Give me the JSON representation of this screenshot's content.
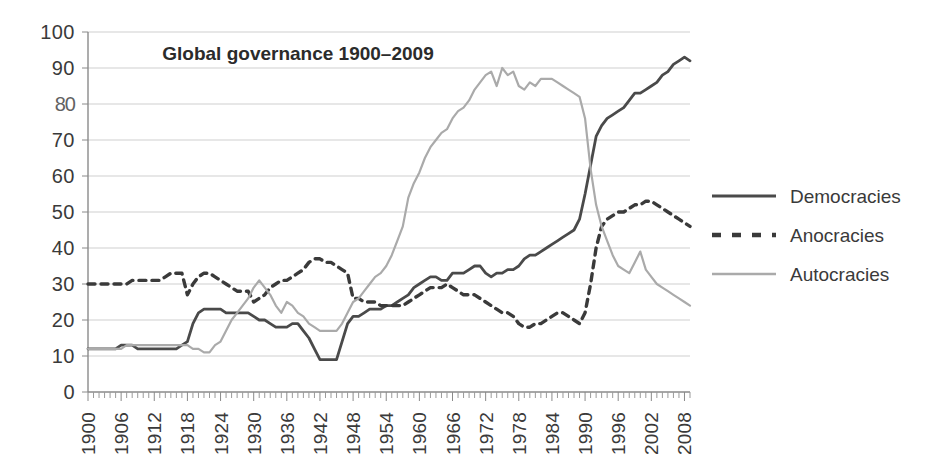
{
  "chart_data": {
    "type": "line",
    "title": "Global governance 1900–2009",
    "xlabel": "",
    "ylabel": "",
    "xlim": [
      1900,
      2009
    ],
    "ylim": [
      0,
      100
    ],
    "grid": true,
    "legend_position": "right",
    "y_ticks": [
      "0",
      "10",
      "20",
      "30",
      "40",
      "50",
      "60",
      "70",
      "80",
      "90",
      "100"
    ],
    "y_tick_values": [
      0,
      10,
      20,
      30,
      40,
      50,
      60,
      70,
      80,
      90,
      100
    ],
    "y_tick_degraded_index": 8,
    "x_ticks": [
      "1900",
      "1906",
      "1912",
      "1918",
      "1924",
      "1930",
      "1936",
      "1942",
      "1948",
      "1954",
      "1960",
      "1966",
      "1972",
      "1978",
      "1984",
      "1990",
      "1996",
      "2002",
      "2008"
    ],
    "x_tick_values": [
      1900,
      1906,
      1912,
      1918,
      1924,
      1930,
      1936,
      1942,
      1948,
      1954,
      1960,
      1966,
      1972,
      1978,
      1984,
      1990,
      1996,
      2002,
      2008
    ],
    "x_minor_step": 1,
    "x": [
      1900,
      1901,
      1902,
      1903,
      1904,
      1905,
      1906,
      1907,
      1908,
      1909,
      1910,
      1911,
      1912,
      1913,
      1914,
      1915,
      1916,
      1917,
      1918,
      1919,
      1920,
      1921,
      1922,
      1923,
      1924,
      1925,
      1926,
      1927,
      1928,
      1929,
      1930,
      1931,
      1932,
      1933,
      1934,
      1935,
      1936,
      1937,
      1938,
      1939,
      1940,
      1941,
      1942,
      1943,
      1944,
      1945,
      1946,
      1947,
      1948,
      1949,
      1950,
      1951,
      1952,
      1953,
      1954,
      1955,
      1956,
      1957,
      1958,
      1959,
      1960,
      1961,
      1962,
      1963,
      1964,
      1965,
      1966,
      1967,
      1968,
      1969,
      1970,
      1971,
      1972,
      1973,
      1974,
      1975,
      1976,
      1977,
      1978,
      1979,
      1980,
      1981,
      1982,
      1983,
      1984,
      1985,
      1986,
      1987,
      1988,
      1989,
      1990,
      1991,
      1992,
      1993,
      1994,
      1995,
      1996,
      1997,
      1998,
      1999,
      2000,
      2001,
      2002,
      2003,
      2004,
      2005,
      2006,
      2007,
      2008,
      2009
    ],
    "series": [
      {
        "name": "Democracies",
        "style": "solid",
        "color": "#4a4a4a",
        "values": [
          12,
          12,
          12,
          12,
          12,
          12,
          13,
          13,
          13,
          12,
          12,
          12,
          12,
          12,
          12,
          12,
          12,
          13,
          14,
          19,
          22,
          23,
          23,
          23,
          23,
          22,
          22,
          22,
          22,
          22,
          21,
          20,
          20,
          19,
          18,
          18,
          18,
          19,
          19,
          17,
          15,
          12,
          9,
          9,
          9,
          9,
          14,
          19,
          21,
          21,
          22,
          23,
          23,
          23,
          24,
          24,
          25,
          26,
          27,
          29,
          30,
          31,
          32,
          32,
          31,
          31,
          33,
          33,
          33,
          34,
          35,
          35,
          33,
          32,
          33,
          33,
          34,
          34,
          35,
          37,
          38,
          38,
          39,
          40,
          41,
          42,
          43,
          44,
          45,
          48,
          55,
          63,
          71,
          74,
          76,
          77,
          78,
          79,
          81,
          83,
          83,
          84,
          85,
          86,
          88,
          89,
          91,
          92,
          93,
          92
        ],
        "start_value": 12,
        "end_value": 92,
        "min_value": 9,
        "min_year": 1942,
        "max_value": 93,
        "max_year": 2008
      },
      {
        "name": "Anocracies",
        "style": "dashed",
        "color": "#3a3a3a",
        "values": [
          30,
          30,
          30,
          30,
          30,
          30,
          30,
          30,
          31,
          31,
          31,
          31,
          31,
          31,
          32,
          33,
          33,
          33,
          27,
          30,
          32,
          33,
          33,
          32,
          31,
          30,
          29,
          28,
          28,
          28,
          25,
          26,
          27,
          29,
          30,
          31,
          31,
          32,
          33,
          34,
          36,
          37,
          37,
          36,
          36,
          35,
          34,
          33,
          26,
          26,
          25,
          25,
          25,
          24,
          24,
          24,
          24,
          24,
          25,
          26,
          27,
          28,
          29,
          29,
          29,
          30,
          29,
          28,
          27,
          27,
          27,
          26,
          25,
          24,
          23,
          22,
          22,
          21,
          19,
          18,
          18,
          19,
          19,
          20,
          21,
          22,
          22,
          21,
          20,
          19,
          22,
          30,
          40,
          46,
          48,
          49,
          50,
          50,
          51,
          52,
          52,
          53,
          53,
          52,
          51,
          50,
          49,
          48,
          47,
          46
        ],
        "start_value": 30,
        "end_value": 46,
        "min_value": 18,
        "min_year": 1980,
        "max_value": 53,
        "max_year": 2002
      },
      {
        "name": "Autocracies",
        "style": "solid",
        "color": "#aaaaaa",
        "values": [
          12,
          12,
          12,
          12,
          12,
          12,
          12,
          13,
          13,
          13,
          13,
          13,
          13,
          13,
          13,
          13,
          13,
          13,
          13,
          12,
          12,
          11,
          11,
          13,
          14,
          17,
          20,
          22,
          24,
          26,
          29,
          31,
          29,
          27,
          24,
          22,
          25,
          24,
          22,
          21,
          19,
          18,
          17,
          17,
          17,
          17,
          19,
          22,
          25,
          26,
          28,
          30,
          32,
          33,
          35,
          38,
          42,
          46,
          54,
          58,
          61,
          65,
          68,
          70,
          72,
          73,
          76,
          78,
          79,
          81,
          84,
          86,
          88,
          89,
          85,
          90,
          88,
          89,
          85,
          84,
          86,
          85,
          87,
          87,
          87,
          86,
          85,
          84,
          83,
          82,
          76,
          62,
          52,
          46,
          42,
          38,
          35,
          34,
          33,
          36,
          39,
          34,
          32,
          30,
          29,
          28,
          27,
          26,
          25,
          24
        ],
        "start_value": 12,
        "end_value": 24,
        "min_value": 11,
        "min_year": 1921,
        "max_value": 90,
        "max_year": 1975
      }
    ]
  },
  "legend": {
    "items": [
      {
        "label": "Democracies",
        "swatch": "solid-dark-line-icon"
      },
      {
        "label": "Anocracies",
        "swatch": "dashed-dark-line-icon"
      },
      {
        "label": "Autocracies",
        "swatch": "solid-light-line-icon"
      }
    ]
  },
  "colors": {
    "democracies": "#4a4a4a",
    "anocracies": "#3a3a3a",
    "autocracies": "#aaaaaa",
    "gridline": "#cfcfcf",
    "axis": "#8a8a8a",
    "text": "#3a3a3a",
    "background": "#ffffff"
  }
}
